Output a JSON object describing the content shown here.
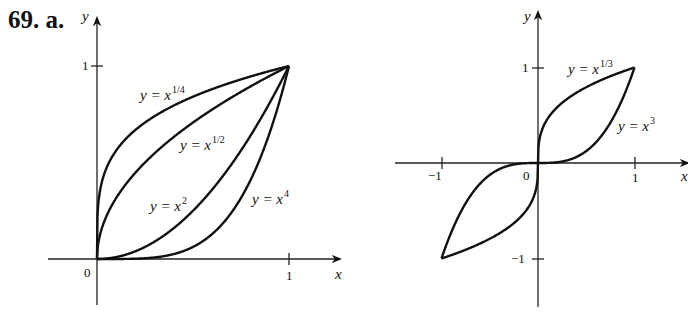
{
  "problem_label": "69. a.",
  "chart_data": [
    {
      "type": "line",
      "title": "",
      "xlabel": "x",
      "ylabel": "y",
      "xlim": [
        0,
        1
      ],
      "ylim": [
        0,
        1
      ],
      "x_ticks": [
        "0",
        "1"
      ],
      "y_ticks": [
        "1"
      ],
      "grid": false,
      "series": [
        {
          "name": "y = x^(1/4)",
          "label_base": "y = x",
          "label_exp": "1/4",
          "function": "x^(1/4)",
          "x": [
            0,
            0.01,
            0.05,
            0.1,
            0.25,
            0.5,
            0.75,
            1
          ],
          "values": [
            0,
            0.316,
            0.473,
            0.562,
            0.707,
            0.841,
            0.931,
            1
          ]
        },
        {
          "name": "y = x^(1/2)",
          "label_base": "y = x",
          "label_exp": "1/2",
          "function": "x^(1/2)",
          "x": [
            0,
            0.01,
            0.05,
            0.1,
            0.25,
            0.5,
            0.75,
            1
          ],
          "values": [
            0,
            0.1,
            0.224,
            0.316,
            0.5,
            0.707,
            0.866,
            1
          ]
        },
        {
          "name": "y = x^2",
          "label_base": "y = x",
          "label_exp": "2",
          "function": "x^2",
          "x": [
            0,
            0.25,
            0.5,
            0.75,
            1
          ],
          "values": [
            0,
            0.0625,
            0.25,
            0.5625,
            1
          ]
        },
        {
          "name": "y = x^4",
          "label_base": "y = x",
          "label_exp": "4",
          "function": "x^4",
          "x": [
            0,
            0.25,
            0.5,
            0.75,
            1
          ],
          "values": [
            0,
            0.0039,
            0.0625,
            0.3164,
            1
          ]
        }
      ]
    },
    {
      "type": "line",
      "title": "",
      "xlabel": "x",
      "ylabel": "y",
      "xlim": [
        -1,
        1
      ],
      "ylim": [
        -1,
        1
      ],
      "x_ticks": [
        "-1",
        "0",
        "1"
      ],
      "y_ticks": [
        "1",
        "-1"
      ],
      "grid": false,
      "series": [
        {
          "name": "y = x^(1/3)",
          "label_base": "y = x",
          "label_exp": "1/3",
          "function": "x^(1/3)",
          "x": [
            -1,
            -0.5,
            -0.1,
            0,
            0.1,
            0.5,
            1
          ],
          "values": [
            -1,
            -0.794,
            -0.464,
            0,
            0.464,
            0.794,
            1
          ]
        },
        {
          "name": "y = x^3",
          "label_base": "y = x",
          "label_exp": "3",
          "function": "x^3",
          "x": [
            -1,
            -0.5,
            0,
            0.5,
            1
          ],
          "values": [
            -1,
            -0.125,
            0,
            0.125,
            1
          ]
        }
      ]
    }
  ],
  "labels": {
    "left": {
      "y_axis": "y",
      "x_axis": "x",
      "origin": "0",
      "x_tick_1": "1",
      "y_tick_1": "1",
      "eq1_base": "y = x",
      "eq1_exp": "1/4",
      "eq2_base": "y = x",
      "eq2_exp": "1/2",
      "eq3_base": "y = x",
      "eq3_exp": "2",
      "eq4_base": "y = x",
      "eq4_exp": "4"
    },
    "right": {
      "y_axis": "y",
      "x_axis": "x",
      "origin": "0",
      "x_tick_neg1": "−1",
      "x_tick_1": "1",
      "y_tick_1": "1",
      "y_tick_neg1": "−1",
      "eq1_base": "y = x",
      "eq1_exp": "1/3",
      "eq2_base": "y = x",
      "eq2_exp": "3"
    }
  }
}
